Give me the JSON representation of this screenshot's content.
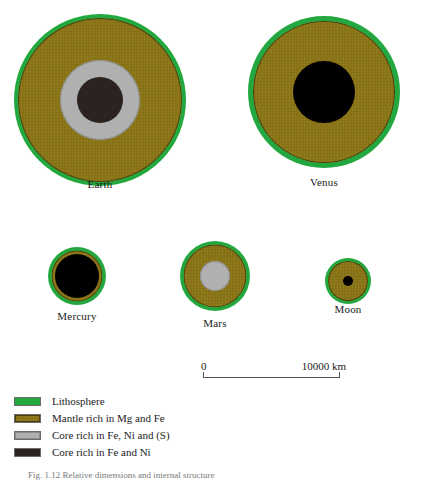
{
  "figure": {
    "caption": "Fig. 1.12  Relative dimensions and internal structure"
  },
  "bodies": [
    {
      "name": "Earth",
      "label": "Earth",
      "layers": [
        {
          "layer": "lithosphere",
          "diameter_px": 172,
          "color": "#22a83f"
        },
        {
          "layer": "mantle",
          "diameter_px": 164,
          "color": "#8a7415"
        },
        {
          "layer": "outer-core",
          "diameter_px": 80,
          "color": "#b0b0b0"
        },
        {
          "layer": "inner-core",
          "diameter_px": 46,
          "color": "#2a2320"
        }
      ]
    },
    {
      "name": "Venus",
      "label": "Venus",
      "layers": [
        {
          "layer": "lithosphere",
          "diameter_px": 152,
          "color": "#22a83f"
        },
        {
          "layer": "mantle",
          "diameter_px": 142,
          "color": "#8a7415"
        },
        {
          "layer": "core",
          "diameter_px": 62,
          "color": "#000000"
        }
      ]
    },
    {
      "name": "Mercury",
      "label": "Mercury",
      "layers": [
        {
          "layer": "lithosphere",
          "diameter_px": 58,
          "color": "#22a83f"
        },
        {
          "layer": "mantle",
          "diameter_px": 51,
          "color": "#8a7415"
        },
        {
          "layer": "core",
          "diameter_px": 44,
          "color": "#000000"
        }
      ]
    },
    {
      "name": "Mars",
      "label": "Mars",
      "layers": [
        {
          "layer": "lithosphere",
          "diameter_px": 70,
          "color": "#22a83f"
        },
        {
          "layer": "mantle",
          "diameter_px": 63,
          "color": "#8a7415"
        },
        {
          "layer": "core",
          "diameter_px": 30,
          "color": "#b0b0b0"
        }
      ]
    },
    {
      "name": "Moon",
      "label": "Moon",
      "layers": [
        {
          "layer": "lithosphere",
          "diameter_px": 46,
          "color": "#22a83f"
        },
        {
          "layer": "mantle",
          "diameter_px": 40,
          "color": "#8a7415"
        },
        {
          "layer": "core",
          "diameter_px": 10,
          "color": "#000000"
        }
      ]
    }
  ],
  "scale": {
    "min_label": "0",
    "max_label": "10000 km",
    "min_value": 0,
    "max_value": 10000,
    "unit": "km"
  },
  "legend": {
    "items": [
      {
        "label": "Lithosphere",
        "color": "#22a83f",
        "swatch": "lith"
      },
      {
        "label": "Mantle rich in Mg and Fe",
        "color": "#8a7415",
        "swatch": "mantle"
      },
      {
        "label": "Core rich in Fe, Ni and (S)",
        "color": "#b0b0b0",
        "swatch": "ocore"
      },
      {
        "label": "Core rich in Fe and Ni",
        "color": "#2a2320",
        "swatch": "icore"
      }
    ]
  }
}
